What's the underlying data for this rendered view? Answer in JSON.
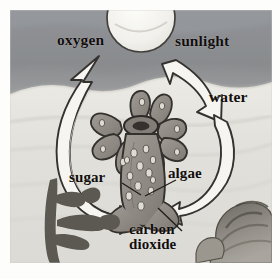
{
  "figure": {
    "kind": "watercolor-illustration",
    "scene": {
      "sky_band": "dark gray-blue sky above waterline",
      "water_band": "pale gray-white underwater region",
      "seafloor": "pale sand"
    }
  },
  "labels": {
    "oxygen": "oxygen",
    "sunlight": "sunlight",
    "water": "water",
    "sugar": "sugar",
    "algae": "algae",
    "carbon_dioxide_line1": "carbon",
    "carbon_dioxide_line2": "dioxide"
  },
  "elements": {
    "sun": "sun-disc",
    "arrow_oxygen": "curved-up-arrow-oxygen",
    "arrow_sunlight": "curved-down-arrow-sunlight",
    "arrow_water_co2": "curved-down-left-arrow-water-carbon-dioxide",
    "polyp": "coral-polyp-with-tentacles",
    "algae_cells": "algae-cells-inside-polyp",
    "seaweed": "branching-seaweed-left",
    "brain_coral": "lumpy-coral-rock-right"
  },
  "colors": {
    "sky": "#8c8f91",
    "water": "#e0e0dc",
    "seafloor": "#dedcd6",
    "polyp_fill": "#8f8a84",
    "polyp_outline": "#2a2724",
    "arrow_fill": "#f6f5f1",
    "arrow_outline": "#2b2825",
    "seaweed": "#5b5750",
    "coral_rock": "#7e7a73",
    "text": "#100d0b",
    "page": "#fdfdfb"
  }
}
